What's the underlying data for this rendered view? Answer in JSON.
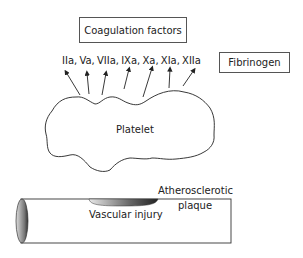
{
  "diagram": {
    "coagulation_box": {
      "label": "Coagulation factors"
    },
    "factors": {
      "label": "IIa, Va, VIIa, IXa,  Xa, XIa, XIIa",
      "items": [
        "IIa",
        "Va",
        "VIIa",
        "IXa",
        "Xa",
        "XIa",
        "XIIa"
      ]
    },
    "fibrinogen_box": {
      "label": "Fibrinogen"
    },
    "platelet": {
      "label": "Platelet"
    },
    "plaque": {
      "label_line1": "Atherosclerotic",
      "label_line2": "plaque"
    },
    "injury": {
      "label": "Vascular injury"
    },
    "colors": {
      "line": "#333333",
      "background": "#ffffff"
    }
  }
}
